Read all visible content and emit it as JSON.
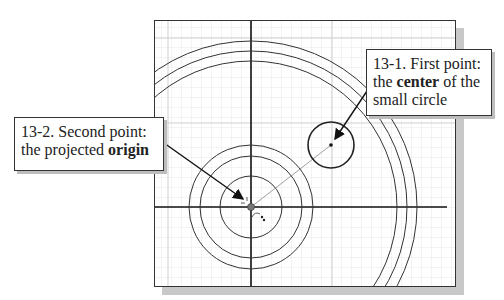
{
  "top_text_fragment": "",
  "callouts": {
    "first_point": {
      "line1": "13-1. First point:",
      "line2_pre": "the ",
      "line2_bold": "center",
      "line2_post": " of the",
      "line3": "small circle"
    },
    "second_point": {
      "line1": "13-2. Second point:",
      "line2_pre": "the projected ",
      "line2_bold": "origin"
    }
  },
  "drawing": {
    "origin": {
      "x": 96,
      "y": 186
    },
    "concentric_circle_radii": [
      31,
      51,
      62
    ],
    "large_arc_radii": [
      146,
      156,
      166
    ],
    "small_circle": {
      "cx": 176,
      "cy": 124,
      "r": 23
    },
    "grid_minor_spacing": 10,
    "colors": {
      "grid_minor": "#e6e6e6",
      "grid_major": "#c9c9c9",
      "stroke": "#222222",
      "axis": "#111111"
    }
  }
}
